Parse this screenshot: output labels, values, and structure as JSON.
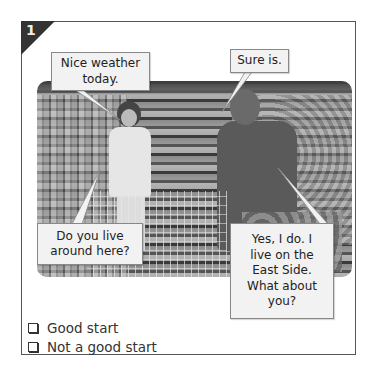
{
  "exercise": {
    "number": "1",
    "photo_alt": "Two people talking in a supermarket aisle with shopping carts",
    "bubbles": [
      {
        "speaker": "woman",
        "text": "Nice weather today."
      },
      {
        "speaker": "man",
        "text": "Sure is."
      },
      {
        "speaker": "woman",
        "text": "Do you live around here?"
      },
      {
        "speaker": "man",
        "text": "Yes, I do. I live on the East Side. What about you?"
      }
    ],
    "options": [
      {
        "label": "Good start",
        "checked": false
      },
      {
        "label": "Not a good start",
        "checked": false
      }
    ]
  },
  "colors": {
    "frame_border": "#555555",
    "corner_badge": "#333333",
    "bubble_bg": "#f2f2f2"
  }
}
